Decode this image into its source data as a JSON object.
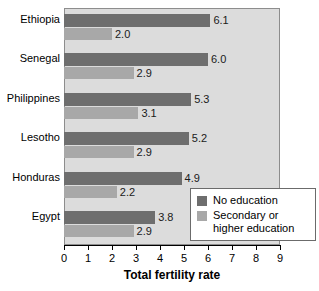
{
  "chart_data": {
    "type": "bar",
    "orientation": "horizontal",
    "title": "",
    "xlabel": "Total fertility rate",
    "ylabel": "",
    "xlim": [
      0,
      9
    ],
    "xticks": [
      "0",
      "1",
      "2",
      "3",
      "4",
      "5",
      "6",
      "7",
      "8",
      "9"
    ],
    "grid": false,
    "legend_position": "bottom-right",
    "categories": [
      "Ethiopia",
      "Senegal",
      "Philippines",
      "Lesotho",
      "Honduras",
      "Egypt"
    ],
    "series": [
      {
        "name": "No education",
        "color": "#6e6e6e",
        "values": [
          6.1,
          6.0,
          5.3,
          5.2,
          4.9,
          3.8
        ],
        "labels": [
          "6.1",
          "6.0",
          "5.3",
          "5.2",
          "4.9",
          "3.8"
        ]
      },
      {
        "name": "Secondary or higher education",
        "color": "#a8a8a8",
        "values": [
          2.0,
          2.9,
          3.1,
          2.9,
          2.2,
          2.9
        ],
        "labels": [
          "2.0",
          "2.9",
          "3.1",
          "2.9",
          "2.2",
          "2.9"
        ]
      }
    ]
  },
  "legend": {
    "items": [
      {
        "label": "No education",
        "label_line2": ""
      },
      {
        "label": "Secondary or",
        "label_line2": "higher education"
      }
    ]
  },
  "colors": {
    "plot_background": "#dcdcdc",
    "page_background": "#ffffff",
    "series_no_education": "#6e6e6e",
    "series_secondary_education": "#a8a8a8",
    "axis": "#000000"
  }
}
